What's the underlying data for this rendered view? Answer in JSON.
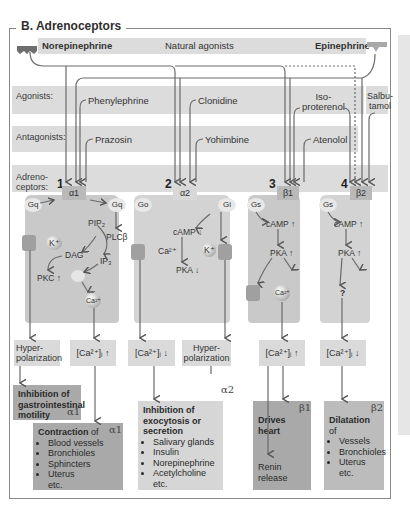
{
  "title": "B. Adrenoceptors",
  "natural_agonists": {
    "left": "Norepinephrine",
    "center": "Natural agonists",
    "right": "Epinephrine"
  },
  "rows": {
    "agonists_label": "Agonists:",
    "antagonists_label": "Antagonists:",
    "adrenoceptors_label": "Adreno-\nceptors:"
  },
  "agonists": [
    "Phenylephrine",
    "Clonidine",
    "Iso-\nproterenol",
    "Salbu-\ntamol"
  ],
  "antagonists": [
    "Prazosin",
    "Yohimbine",
    "Atenolol"
  ],
  "receptors": [
    {
      "number": "1",
      "name": "α1",
      "g_left": "Gq",
      "g_right": "Gq"
    },
    {
      "number": "2",
      "name": "α2",
      "g_left": "Go",
      "g_right": "Gi"
    },
    {
      "number": "3",
      "name": "β1",
      "g_left": "Gs"
    },
    {
      "number": "4",
      "name": "β2",
      "g_left": "Gs"
    }
  ],
  "signaling": {
    "alpha1": {
      "k": "K⁺",
      "pip2": "PIP₂",
      "plc": "PLCβ",
      "dag": "DAG",
      "ip3": "IP₃",
      "pkc": "PKC ↑",
      "ca": "Ca²⁺"
    },
    "alpha2": {
      "ca": "Ca²⁺",
      "camp": "cAMP ↓",
      "pka": "PKA ↓",
      "k": "K⁺"
    },
    "beta1": {
      "camp": "cAMP ↑",
      "pka": "PKA ↑",
      "ca": "Ca²⁺"
    },
    "beta2": {
      "camp": "cAMP ↑",
      "pka": "PKA ↑",
      "q": "?"
    }
  },
  "effects": [
    "Hyper-\npolarization",
    "[Ca²⁺]ᵢ ↑",
    "[Ca²⁺]ᵢ ↓",
    "Hyper-\npolarization",
    "[Ca²⁺]ᵢ ↑",
    "[Ca²⁺]ᵢ ↓"
  ],
  "results": {
    "gi_motility": {
      "title": "Inhibition of gastrointestinal motility",
      "receptor": "α1"
    },
    "contraction": {
      "title": "Contraction",
      "suffix": " of",
      "items": [
        "Blood vessels",
        "Bronchioles",
        "Sphincters",
        "Uterus"
      ],
      "etc": "etc.",
      "receptor": "α1"
    },
    "exocytosis": {
      "title": "Inhibition of exocytosis or secretion",
      "items": [
        "Salivary glands",
        "Insulin",
        "Norepinephrine",
        "Acetylcholine"
      ],
      "etc": "etc.",
      "receptor": "α2"
    },
    "heart": {
      "title": "Drives heart",
      "sub": "Renin release",
      "receptor": "β1"
    },
    "dilatation": {
      "title": "Dilatation",
      "suffix": " of",
      "items": [
        "Vessels",
        "Bronchioles",
        "Uterus"
      ],
      "etc": "etc.",
      "receptor": "β2"
    }
  },
  "colors": {
    "band": "#dcdcdc",
    "cell": "#c9c9c9",
    "receptor": "#b9b9b9",
    "result_dark": "#a9a9a9",
    "result_light": "#d6d6d6",
    "line": "#555555"
  }
}
